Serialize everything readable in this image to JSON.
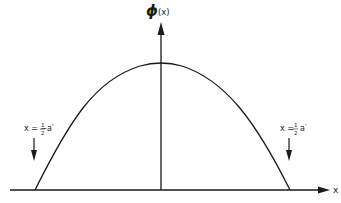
{
  "diagram": {
    "y_axis_label_symbol": "ϕ",
    "y_axis_label_arg": "(x)",
    "x_axis_label": "x",
    "left_marker": {
      "prefix": "x = −",
      "frac_num": "1",
      "frac_den": "2",
      "suffix": "a′"
    },
    "right_marker": {
      "prefix": "x = ",
      "frac_num": "1",
      "frac_den": "2",
      "suffix": "a′"
    },
    "curve": "cosine-like bump peaking at x=0, zero at x=±a′/2"
  },
  "colors": {
    "line": "#1a1a1a",
    "background": "#ffffff"
  }
}
